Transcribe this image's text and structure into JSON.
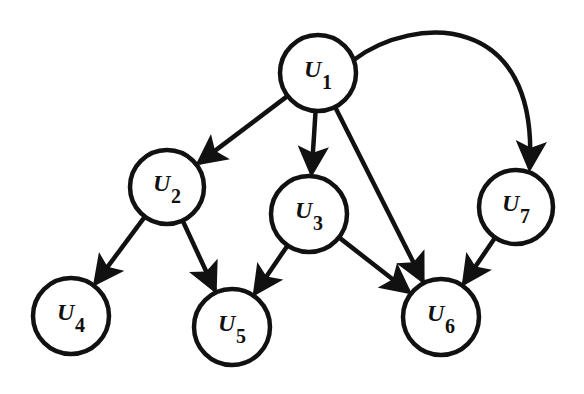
{
  "diagram": {
    "type": "directed-graph",
    "colors": {
      "stroke": "#111111",
      "fill": "#ffffff",
      "background": "#ffffff"
    },
    "nodes": [
      {
        "id": "U1",
        "base": "U",
        "sub": "1",
        "cx": 318,
        "cy": 73,
        "r": 38
      },
      {
        "id": "U2",
        "base": "U",
        "sub": "2",
        "cx": 167,
        "cy": 187,
        "r": 37
      },
      {
        "id": "U3",
        "base": "U",
        "sub": "3",
        "cx": 309,
        "cy": 214,
        "r": 38
      },
      {
        "id": "U4",
        "base": "U",
        "sub": "4",
        "cx": 71,
        "cy": 316,
        "r": 38
      },
      {
        "id": "U5",
        "base": "U",
        "sub": "5",
        "cx": 232,
        "cy": 327,
        "r": 38
      },
      {
        "id": "U6",
        "base": "U",
        "sub": "6",
        "cx": 441,
        "cy": 317,
        "r": 38
      },
      {
        "id": "U7",
        "base": "U",
        "sub": "7",
        "cx": 516,
        "cy": 207,
        "r": 37
      }
    ],
    "edges": [
      {
        "from": "U1",
        "to": "U2"
      },
      {
        "from": "U1",
        "to": "U3"
      },
      {
        "from": "U1",
        "to": "U6"
      },
      {
        "from": "U1",
        "to": "U7",
        "curved": true
      },
      {
        "from": "U2",
        "to": "U4"
      },
      {
        "from": "U2",
        "to": "U5"
      },
      {
        "from": "U3",
        "to": "U5"
      },
      {
        "from": "U3",
        "to": "U6"
      },
      {
        "from": "U7",
        "to": "U6"
      }
    ]
  }
}
